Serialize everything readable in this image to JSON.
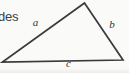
{
  "figure": {
    "kind": "triangle-sides-diagram",
    "cropped_text_fragment": "des",
    "side_labels": {
      "a": "a",
      "b": "b",
      "c": "c"
    },
    "geometry": {
      "apex": {
        "x": 84.5,
        "y": 3
      },
      "bottom_left": {
        "x": 2.5,
        "y": 62
      },
      "bottom_right": {
        "x": 123,
        "y": 60
      },
      "stroke_width": 1.7
    },
    "label_positions": {
      "a": {
        "x": 35.5,
        "y": 25.5
      },
      "b": {
        "x": 112,
        "y": 27.5
      },
      "c": {
        "x": 68.5,
        "y": 67
      }
    },
    "colors": {
      "background": "#fafaf8",
      "line": "#3a3a3a",
      "label_text": "#333333",
      "fragment_text": "#3d3d3d"
    }
  }
}
